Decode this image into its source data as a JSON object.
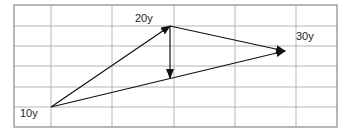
{
  "diagram": {
    "grid": {
      "left": 14,
      "right": 337,
      "top": 5,
      "bottom": 127,
      "v_lines": [
        51,
        112,
        174,
        235,
        296
      ],
      "h_lines": [
        26,
        46,
        66,
        87,
        107
      ],
      "line_color": "#b5b5b5",
      "border_color": "#888888"
    },
    "points": {
      "p10": {
        "label": "10y",
        "x": 51,
        "y": 107,
        "lx": 20,
        "ly": 117
      },
      "p20": {
        "label": "20y",
        "x": 170,
        "y": 26,
        "lx": 135,
        "ly": 22
      },
      "p30": {
        "label": "30y",
        "x": 285,
        "y": 51,
        "lx": 296,
        "ly": 40
      },
      "pmid": {
        "x": 170,
        "y": 78
      }
    },
    "arrows": [
      {
        "from": "p10",
        "to": "p20"
      },
      {
        "from": "p10",
        "to": "p30"
      },
      {
        "from": "p20",
        "to": "p30"
      },
      {
        "from": "p20",
        "to": "pmid"
      }
    ],
    "arrow_color": "#111111"
  }
}
